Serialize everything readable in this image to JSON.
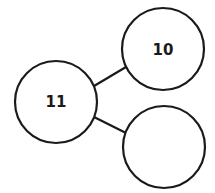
{
  "diagram": {
    "type": "number-bond",
    "stroke_color": "#1a1a1a",
    "background": "#ffffff",
    "nodes": [
      {
        "id": "whole",
        "label": "11",
        "cx": 56,
        "cy": 102,
        "r": 41
      },
      {
        "id": "part-top",
        "label": "10",
        "cx": 163,
        "cy": 49,
        "r": 41
      },
      {
        "id": "part-bottom",
        "label": "",
        "cx": 164,
        "cy": 147,
        "r": 41
      }
    ],
    "edges": [
      {
        "from": "whole",
        "to": "part-top"
      },
      {
        "from": "whole",
        "to": "part-bottom"
      }
    ]
  }
}
